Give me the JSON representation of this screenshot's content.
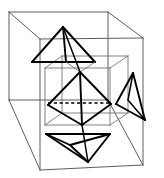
{
  "figure": {
    "caption": "",
    "background_color": "#ffffff",
    "width": 164,
    "height": 178,
    "colors": {
      "outer_cube_stroke": "#4a4a4a",
      "inner_cube_stroke": "#6b6b6b",
      "solid_stroke": "#000000",
      "hidden_stroke": "#000000"
    },
    "style": {
      "outer_cube_width": 0.9,
      "inner_cube_width": 0.85,
      "solid_width": 1.9,
      "hidden_dasharray": "3.2 2.6"
    }
  },
  "outer_cube": {
    "name": "outer-cube-wireframe",
    "vertices": {
      "front_top_left": [
        9,
        12
      ],
      "front_top_right": [
        108,
        12
      ],
      "front_bottom_right": [
        108,
        100
      ],
      "front_bottom_left": [
        9,
        100
      ],
      "back_top_left": [
        40,
        -4
      ],
      "back_top_right": [
        143,
        38
      ],
      "back_bottom_right": [
        143,
        165
      ],
      "back_bottom_left": [
        40,
        170
      ]
    },
    "edges": [
      "front-top",
      "front-right",
      "front-bottom",
      "front-left",
      "top-left-diagonal",
      "top-right-diagonal",
      "right-vertical",
      "bottom-right-diagonal",
      "bottom-edge",
      "left-bottom-diagonal"
    ]
  },
  "inner_cube": {
    "name": "inner-cube-wireframe",
    "vertices": {
      "front_top_left": [
        45,
        68
      ],
      "front_top_right": [
        110,
        68
      ],
      "front_bottom_right": [
        110,
        125
      ],
      "front_bottom_left": [
        45,
        125
      ],
      "back_top_left": [
        62,
        56
      ],
      "back_top_right": [
        128,
        56
      ],
      "back_bottom_right": [
        128,
        113
      ],
      "back_bottom_left": [
        62,
        113
      ]
    }
  },
  "octahedron": {
    "name": "central-octahedron",
    "vertices": {
      "apex_top": [
        80,
        72
      ],
      "left": [
        48,
        105
      ],
      "right": [
        111,
        104
      ],
      "front": [
        82,
        125
      ],
      "back": [
        78,
        96
      ]
    },
    "hidden_edge": {
      "from": [
        48,
        103
      ],
      "to": [
        111,
        103
      ],
      "style": "dashed"
    },
    "visible_edge_count": 8,
    "hidden_edge_count": 1
  },
  "pyramids": [
    {
      "name": "top-pyramid",
      "position": "upper-left",
      "apex": [
        63,
        27
      ],
      "base": [
        [
          32,
          62
        ],
        [
          95,
          62
        ],
        [
          78,
          50
        ]
      ]
    },
    {
      "name": "bottom-pyramid",
      "position": "lower-center",
      "apex": [
        88,
        162
      ],
      "base": [
        [
          46,
          134
        ],
        [
          110,
          134
        ],
        [
          70,
          145
        ]
      ]
    },
    {
      "name": "right-pyramid",
      "position": "right-side",
      "apex": [
        133,
        73
      ],
      "base": [
        [
          115,
          103
        ],
        [
          145,
          120
        ],
        [
          128,
          100
        ]
      ]
    }
  ],
  "labels": {
    "has_text": false,
    "text_items": []
  }
}
